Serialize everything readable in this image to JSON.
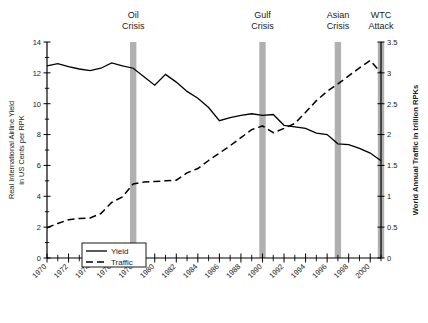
{
  "chart_data": {
    "type": "line",
    "title": "",
    "xlabel": "",
    "ylabel": "Real International Airline Yield in US Cents per RPK",
    "y2label": "World Annual Traffic in trillion RPKs",
    "ylim": [
      0,
      14
    ],
    "y2lim": [
      0,
      3.5
    ],
    "xlim": [
      1970,
      2001
    ],
    "grid": false,
    "legend_position": "bottom-left",
    "yticks": [
      0,
      2,
      4,
      6,
      8,
      10,
      12,
      14
    ],
    "ytick_labels": [
      "0",
      "2",
      "4",
      "6",
      "8",
      "10",
      "12",
      "14"
    ],
    "y2ticks": [
      0,
      0.5,
      1,
      1.5,
      2,
      2.5,
      3,
      3.5
    ],
    "y2tick_labels": [
      "0",
      "0.5",
      "1",
      "1.5",
      "2",
      "2.5",
      "3",
      "3.5"
    ],
    "xticks": [
      1970,
      1972,
      1974,
      1976,
      1978,
      1980,
      1982,
      1984,
      1986,
      1988,
      1990,
      1992,
      1994,
      1996,
      1998,
      2000
    ],
    "xtick_labels": [
      "1970",
      "1972",
      "1974",
      "1976",
      "1978",
      "1980",
      "1982",
      "1984",
      "1986",
      "1988",
      "1990",
      "1992",
      "1994",
      "1996",
      "1998",
      "2000"
    ],
    "x": [
      1970,
      1971,
      1972,
      1973,
      1974,
      1975,
      1976,
      1977,
      1978,
      1979,
      1980,
      1981,
      1982,
      1983,
      1984,
      1985,
      1986,
      1987,
      1988,
      1989,
      1990,
      1991,
      1992,
      1993,
      1994,
      1995,
      1996,
      1997,
      1998,
      1999,
      2000,
      2001
    ],
    "series": [
      {
        "name": "Yield",
        "axis": "left",
        "style": "solid",
        "units": "US Cents per RPK",
        "values": [
          12.45,
          12.6,
          12.4,
          12.25,
          12.15,
          12.3,
          12.65,
          12.45,
          12.3,
          11.75,
          11.2,
          11.9,
          11.4,
          10.8,
          10.35,
          9.75,
          8.9,
          9.1,
          9.25,
          9.35,
          9.25,
          9.3,
          8.6,
          8.5,
          8.4,
          8.1,
          8.0,
          7.4,
          7.35,
          7.1,
          6.8,
          6.3
        ]
      },
      {
        "name": "Traffic",
        "axis": "right",
        "style": "dashed",
        "units": "trillion RPKs",
        "values": [
          0.49,
          0.56,
          0.62,
          0.64,
          0.65,
          0.72,
          0.9,
          0.99,
          1.2,
          1.23,
          1.24,
          1.25,
          1.26,
          1.38,
          1.45,
          1.58,
          1.7,
          1.82,
          1.95,
          2.08,
          2.14,
          2.03,
          2.1,
          2.18,
          2.36,
          2.55,
          2.7,
          2.82,
          2.95,
          3.08,
          3.2,
          3.0
        ]
      }
    ],
    "annotations": [
      {
        "label_line1": "Oil",
        "label_line2": "Crisis",
        "name": "oil-crisis",
        "x": 1978,
        "color": "#b0b0b0"
      },
      {
        "label_line1": "Gulf",
        "label_line2": "Crisis",
        "name": "gulf-crisis",
        "x": 1990,
        "color": "#b0b0b0"
      },
      {
        "label_line1": "Asian",
        "label_line2": "Crisis",
        "name": "asian-crisis",
        "x": 1997,
        "color": "#b0b0b0"
      },
      {
        "label_line1": "WTC",
        "label_line2": "Attack",
        "name": "wtc-attack",
        "x": 2001,
        "color": "#b0b0b0"
      }
    ],
    "legend": [
      {
        "label": "Yield",
        "style": "solid"
      },
      {
        "label": "Traffic",
        "style": "dashed"
      }
    ]
  }
}
